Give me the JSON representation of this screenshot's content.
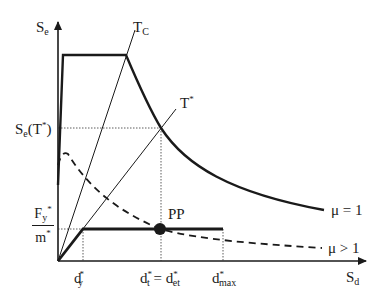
{
  "diagram": {
    "axes": {
      "y_label": {
        "main": "S",
        "sub": "e"
      },
      "x_label": {
        "main": "S",
        "sub": "d"
      }
    },
    "lines": {
      "period_tc": {
        "main": "T",
        "sub": "C"
      },
      "period_tstar": {
        "main": "T",
        "sup": "*"
      }
    },
    "y_annotations": {
      "se_tstar": {
        "main": "S",
        "sub": "e",
        "rest": "(T",
        "sup": "*",
        "close": ")"
      },
      "fy_over_m": {
        "num_main": "F",
        "num_sub": "y",
        "num_sup": "*",
        "den_main": "m",
        "den_sup": "*"
      }
    },
    "x_annotations": {
      "dy": {
        "main": "d",
        "sub": "y",
        "sup": "*"
      },
      "dt_det": {
        "left_main": "d",
        "left_sub": "t",
        "left_sup": "*",
        "eq": " = ",
        "right_main": "d",
        "right_sub": "et",
        "right_sup": "*"
      },
      "dmax": {
        "main": "d",
        "sub": "max",
        "sup": "*"
      }
    },
    "curves": {
      "mu_eq_1": "μ = 1",
      "mu_gt_1": "μ > 1"
    },
    "point_label": "PP",
    "colors": {
      "ink": "#1a1a1a",
      "background": "#ffffff"
    }
  }
}
